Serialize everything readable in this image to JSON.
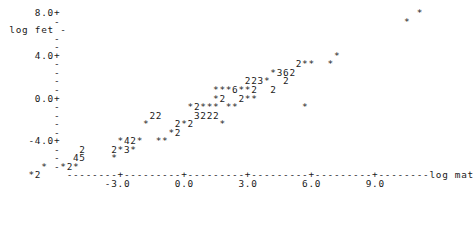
{
  "plot": {
    "type": "character-cell-scatter",
    "y_axis_label": "log fet",
    "x_axis_label": "log mat",
    "y_ticks_labeled": [
      "8.0+",
      "4.0+",
      "0.0+",
      "-4.0+"
    ],
    "x_ticks_labeled": [
      "-3.0",
      "0.0",
      "3.0",
      "6.0",
      "9.0"
    ],
    "tick_mark_minor": "-",
    "tick_mark_major": "+",
    "axis_rule_char": "-",
    "point_char": "*",
    "foreground_color": "#1a1a1a",
    "background_color": "#ffffff",
    "char_width": 6.12,
    "row_height": 8.55,
    "origin_x": 3,
    "origin_y": 8
  },
  "y_axis_rows": [
    {
      "row": 0,
      "label": "     8.0+"
    },
    {
      "row": 1,
      "label": "        -"
    },
    {
      "row": 2,
      "label": " log fet -"
    },
    {
      "row": 3,
      "label": "        -"
    },
    {
      "row": 4,
      "label": "        -"
    },
    {
      "row": 5,
      "label": "     4.0+"
    },
    {
      "row": 6,
      "label": "        -"
    },
    {
      "row": 7,
      "label": "        -"
    },
    {
      "row": 8,
      "label": "        -"
    },
    {
      "row": 9,
      "label": "        -"
    },
    {
      "row": 10,
      "label": "     0.0+"
    },
    {
      "row": 11,
      "label": "        -"
    },
    {
      "row": 12,
      "label": "        -"
    },
    {
      "row": 13,
      "label": "        -"
    },
    {
      "row": 14,
      "label": "        -"
    },
    {
      "row": 15,
      "label": "    -4.0+"
    },
    {
      "row": 16,
      "label": "        -"
    },
    {
      "row": 17,
      "label": "        -"
    },
    {
      "row": 18,
      "label": "        -"
    }
  ],
  "x_axis": {
    "rule": "          --------+---------+---------+---------+---------+--------",
    "rule_suffix_label": "log mat",
    "tick_labels_line": "                -3.0       0.0       3.0       6.0       9.0"
  },
  "data_rows": [
    {
      "row": 0,
      "text": "                                                                 *"
    },
    {
      "row": 1,
      "text": "                                                               *"
    },
    {
      "row": 2,
      "text": ""
    },
    {
      "row": 3,
      "text": ""
    },
    {
      "row": 4,
      "text": ""
    },
    {
      "row": 5,
      "text": "                                                    *"
    },
    {
      "row": 6,
      "text": "                                              2**  *"
    },
    {
      "row": 7,
      "text": "                                          *362"
    },
    {
      "row": 8,
      "text": "                                      223*  2"
    },
    {
      "row": 9,
      "text": "                                 ***6**2  2"
    },
    {
      "row": 10,
      "text": "                                 *2  2**"
    },
    {
      "row": 11,
      "text": "                             *2*** **          *"
    },
    {
      "row": 12,
      "text": "                       22     3222"
    },
    {
      "row": 13,
      "text": "                      *    2*2    *"
    },
    {
      "row": 14,
      "text": "                          *2"
    },
    {
      "row": 15,
      "text": "                  *42*  **"
    },
    {
      "row": 16,
      "text": "            2    2*3*"
    },
    {
      "row": 17,
      "text": "           45    *"
    },
    {
      "row": 18,
      "text": "      *  *2*"
    },
    {
      "row": 19,
      "text": "    *2"
    }
  ],
  "chart_data": {
    "type": "scatter",
    "title": "",
    "xlabel": "log mat",
    "ylabel": "log fet",
    "xlim": [
      -4.5,
      11.0
    ],
    "ylim": [
      -6.0,
      8.5
    ],
    "grid": false,
    "legend": null,
    "encoding": "Character-cell plot: '*' marks one observation in a cell; a digit N marks N overlapping observations in that cell.",
    "xticks": [
      -3.0,
      0.0,
      3.0,
      6.0,
      9.0
    ],
    "yticks": [
      8.0,
      4.0,
      0.0,
      -4.0
    ],
    "points": [
      {
        "x": 9.6,
        "y": 8.0,
        "count": 1
      },
      {
        "x": 9.2,
        "y": 7.2,
        "count": 1
      },
      {
        "x": 6.1,
        "y": 4.0,
        "count": 1
      },
      {
        "x": 4.9,
        "y": 3.2,
        "count": 2
      },
      {
        "x": 5.2,
        "y": 3.2,
        "count": 1
      },
      {
        "x": 5.4,
        "y": 3.2,
        "count": 1
      },
      {
        "x": 6.0,
        "y": 3.2,
        "count": 1
      },
      {
        "x": 4.0,
        "y": 2.4,
        "count": 1
      },
      {
        "x": 4.2,
        "y": 2.4,
        "count": 3
      },
      {
        "x": 4.4,
        "y": 2.4,
        "count": 6
      },
      {
        "x": 4.6,
        "y": 2.4,
        "count": 2
      },
      {
        "x": 3.2,
        "y": 1.6,
        "count": 2
      },
      {
        "x": 3.4,
        "y": 1.6,
        "count": 2
      },
      {
        "x": 3.6,
        "y": 1.6,
        "count": 3
      },
      {
        "x": 3.8,
        "y": 1.6,
        "count": 1
      },
      {
        "x": 4.3,
        "y": 1.6,
        "count": 2
      },
      {
        "x": 2.4,
        "y": 0.8,
        "count": 1
      },
      {
        "x": 2.6,
        "y": 0.8,
        "count": 1
      },
      {
        "x": 2.8,
        "y": 0.8,
        "count": 1
      },
      {
        "x": 3.0,
        "y": 0.8,
        "count": 6
      },
      {
        "x": 3.2,
        "y": 0.8,
        "count": 1
      },
      {
        "x": 3.4,
        "y": 0.8,
        "count": 1
      },
      {
        "x": 3.6,
        "y": 0.8,
        "count": 2
      },
      {
        "x": 4.0,
        "y": 0.8,
        "count": 2
      },
      {
        "x": 2.4,
        "y": 0.0,
        "count": 1
      },
      {
        "x": 2.6,
        "y": 0.0,
        "count": 2
      },
      {
        "x": 3.2,
        "y": 0.0,
        "count": 2
      },
      {
        "x": 3.4,
        "y": 0.0,
        "count": 1
      },
      {
        "x": 3.6,
        "y": 0.0,
        "count": 1
      },
      {
        "x": 1.6,
        "y": -0.8,
        "count": 1
      },
      {
        "x": 1.8,
        "y": -0.8,
        "count": 2
      },
      {
        "x": 2.0,
        "y": -0.8,
        "count": 1
      },
      {
        "x": 2.2,
        "y": -0.8,
        "count": 1
      },
      {
        "x": 2.4,
        "y": -0.8,
        "count": 1
      },
      {
        "x": 2.9,
        "y": -0.8,
        "count": 1
      },
      {
        "x": 3.1,
        "y": -0.8,
        "count": 1
      },
      {
        "x": 6.4,
        "y": -0.8,
        "count": 1
      },
      {
        "x": 0.2,
        "y": -1.6,
        "count": 2
      },
      {
        "x": 0.4,
        "y": -1.6,
        "count": 2
      },
      {
        "x": 1.6,
        "y": -1.6,
        "count": 3
      },
      {
        "x": 1.8,
        "y": -1.6,
        "count": 2
      },
      {
        "x": 2.0,
        "y": -1.6,
        "count": 2
      },
      {
        "x": 2.2,
        "y": -1.6,
        "count": 2
      },
      {
        "x": 0.0,
        "y": -2.4,
        "count": 1
      },
      {
        "x": 0.8,
        "y": -2.4,
        "count": 2
      },
      {
        "x": 1.0,
        "y": -2.4,
        "count": 1
      },
      {
        "x": 1.2,
        "y": -2.4,
        "count": 2
      },
      {
        "x": 2.0,
        "y": -2.4,
        "count": 1
      },
      {
        "x": 1.0,
        "y": -3.2,
        "count": 1
      },
      {
        "x": 1.2,
        "y": -3.2,
        "count": 2
      },
      {
        "x": -0.8,
        "y": -4.0,
        "count": 1
      },
      {
        "x": -0.6,
        "y": -4.0,
        "count": 4
      },
      {
        "x": -0.4,
        "y": -4.0,
        "count": 2
      },
      {
        "x": -0.2,
        "y": -4.0,
        "count": 1
      },
      {
        "x": 0.2,
        "y": -4.0,
        "count": 1
      },
      {
        "x": 0.4,
        "y": -4.0,
        "count": 1
      },
      {
        "x": -2.6,
        "y": -4.8,
        "count": 2
      },
      {
        "x": -1.4,
        "y": -4.8,
        "count": 2
      },
      {
        "x": -1.2,
        "y": -4.8,
        "count": 1
      },
      {
        "x": -1.0,
        "y": -4.8,
        "count": 3
      },
      {
        "x": -0.8,
        "y": -4.8,
        "count": 1
      },
      {
        "x": -2.7,
        "y": -5.2,
        "count": 4
      },
      {
        "x": -2.5,
        "y": -5.2,
        "count": 5
      },
      {
        "x": -1.3,
        "y": -5.2,
        "count": 1
      },
      {
        "x": -3.4,
        "y": -5.6,
        "count": 1
      },
      {
        "x": -3.0,
        "y": -5.6,
        "count": 1
      },
      {
        "x": -2.8,
        "y": -5.6,
        "count": 2
      },
      {
        "x": -2.6,
        "y": -5.6,
        "count": 1
      },
      {
        "x": -3.8,
        "y": -6.0,
        "count": 1
      },
      {
        "x": -3.6,
        "y": -6.0,
        "count": 2
      }
    ]
  }
}
